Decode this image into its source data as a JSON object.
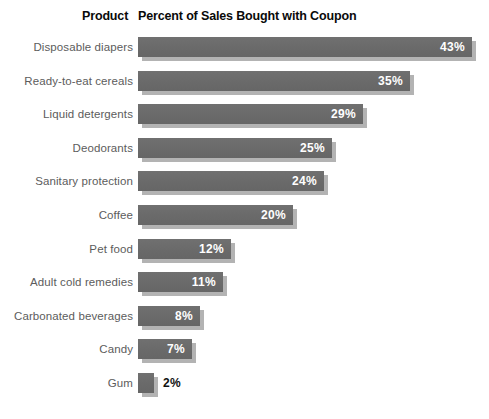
{
  "header": {
    "product_label": "Product",
    "metric_label": "Percent of Sales Bought with Coupon"
  },
  "style": {
    "bar_color": "#6b6b6b",
    "bar_shadow_color": "#b3b3b3",
    "label_color": "#5c5c5c",
    "value_inside_color": "#ffffff",
    "value_outside_color": "#111111",
    "background": "#ffffff"
  },
  "chart_data": {
    "type": "bar",
    "orientation": "horizontal",
    "title": "Percent of Sales Bought with Coupon",
    "subtitle": "",
    "xlabel": "",
    "ylabel": "Product",
    "xlim": [
      0,
      43
    ],
    "grid": false,
    "legend": "none",
    "value_suffix": "%",
    "categories": [
      "Disposable diapers",
      "Ready-to-eat cereals",
      "Liquid detergents",
      "Deodorants",
      "Sanitary protection",
      "Coffee",
      "Pet food",
      "Adult cold remedies",
      "Carbonated beverages",
      "Candy",
      "Gum"
    ],
    "values": [
      43,
      35,
      29,
      25,
      24,
      20,
      12,
      11,
      8,
      7,
      2
    ],
    "data_labels": [
      "43%",
      "35%",
      "29%",
      "25%",
      "24%",
      "20%",
      "12%",
      "11%",
      "8%",
      "7%",
      "2%"
    ],
    "rows": [
      {
        "category": "Disposable diapers",
        "value": 43,
        "label": "43%",
        "label_inside": true
      },
      {
        "category": "Ready-to-eat cereals",
        "value": 35,
        "label": "35%",
        "label_inside": true
      },
      {
        "category": "Liquid detergents",
        "value": 29,
        "label": "29%",
        "label_inside": true
      },
      {
        "category": "Deodorants",
        "value": 25,
        "label": "25%",
        "label_inside": true
      },
      {
        "category": "Sanitary protection",
        "value": 24,
        "label": "24%",
        "label_inside": true
      },
      {
        "category": "Coffee",
        "value": 20,
        "label": "20%",
        "label_inside": true
      },
      {
        "category": "Pet food",
        "value": 12,
        "label": "12%",
        "label_inside": true
      },
      {
        "category": "Adult cold remedies",
        "value": 11,
        "label": "11%",
        "label_inside": true
      },
      {
        "category": "Carbonated beverages",
        "value": 8,
        "label": "8%",
        "label_inside": true
      },
      {
        "category": "Candy",
        "value": 7,
        "label": "7%",
        "label_inside": true
      },
      {
        "category": "Gum",
        "value": 2,
        "label": "2%",
        "label_inside": false
      }
    ]
  }
}
